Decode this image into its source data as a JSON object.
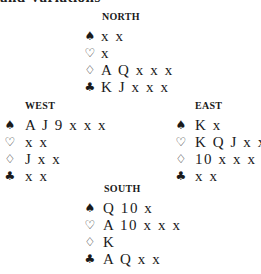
{
  "header": {
    "cut_text": "and Variations"
  },
  "suits": {
    "spades": "♠",
    "hearts": "♡",
    "diamonds": "♢",
    "clubs": "♣"
  },
  "hands": {
    "north": {
      "label": "NORTH",
      "spades": "x x",
      "hearts": "x",
      "diamonds": "A Q x x x",
      "clubs": "K J x x x"
    },
    "west": {
      "label": "WEST",
      "spades": "A J 9 x x x",
      "hearts": "x x",
      "diamonds": "J x x",
      "clubs": "x x"
    },
    "east": {
      "label": "EAST",
      "spades": "K x",
      "hearts": "K Q J x x",
      "diamonds": "10 x x x",
      "clubs": "x x"
    },
    "south": {
      "label": "SOUTH",
      "spades": "Q 10 x",
      "hearts": "A 10 x x x",
      "diamonds": "K",
      "clubs": "A Q x x"
    }
  }
}
